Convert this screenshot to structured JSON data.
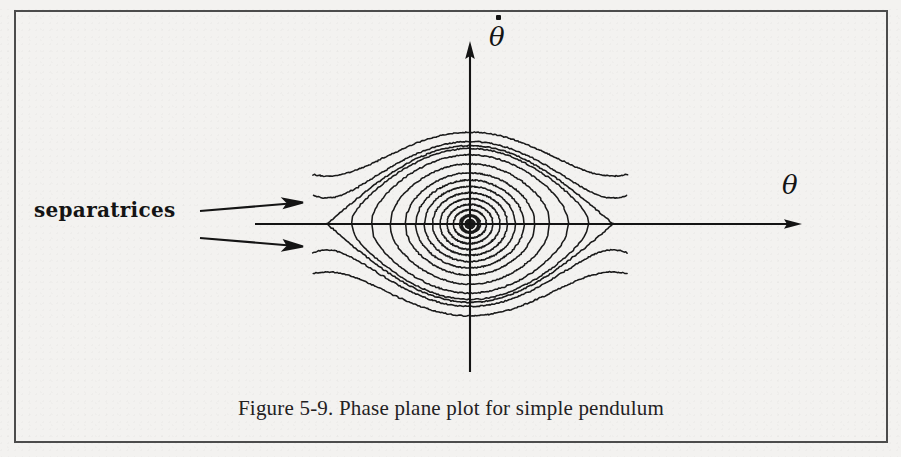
{
  "figure": {
    "caption": "Figure 5-9.  Phase plane plot for simple pendulum",
    "border_color": "#4c4c4c",
    "background_color": "#f3f2f0",
    "curve_color": "#1a1a1a"
  },
  "annotations": {
    "separatrices_label": "separatrices",
    "arrow_count": 2
  },
  "axes": {
    "y_label": "θ",
    "y_label_accent": "dot",
    "y_label_full": "θ̇",
    "x_label": "θ",
    "origin_px": {
      "x": 470,
      "y": 224
    },
    "x_axis_start_px": 255,
    "x_axis_end_px": 800,
    "y_axis_top_px": 43,
    "y_axis_bottom_px": 372
  },
  "chart_data": {
    "type": "line",
    "title": "Figure 5-9.  Phase plane plot for simple pendulum",
    "xlabel": "θ",
    "ylabel": "θ̇",
    "grid": false,
    "legend": null,
    "system": "simple pendulum, thetaddot = -sin(theta)",
    "conserved_quantity": "E = 0.5*thetadot^2 - cos(theta)",
    "xlim": [
      -3.4,
      3.4
    ],
    "ylim": [
      -2.6,
      2.6
    ],
    "fixed_points": [
      {
        "type": "center",
        "theta": 0.0,
        "thetadot": 0.0
      },
      {
        "type": "saddle",
        "theta": -3.1416,
        "thetadot": 0.0
      },
      {
        "type": "saddle",
        "theta": 3.1416,
        "thetadot": 0.0
      }
    ],
    "series": [
      {
        "name": "libration-1",
        "kind": "closed-orbit",
        "energy": -0.995
      },
      {
        "name": "libration-2",
        "kind": "closed-orbit",
        "energy": -0.975
      },
      {
        "name": "libration-3",
        "kind": "closed-orbit",
        "energy": -0.935
      },
      {
        "name": "libration-4",
        "kind": "closed-orbit",
        "energy": -0.875
      },
      {
        "name": "libration-5",
        "kind": "closed-orbit",
        "energy": -0.79
      },
      {
        "name": "libration-6",
        "kind": "closed-orbit",
        "energy": -0.68
      },
      {
        "name": "libration-7",
        "kind": "closed-orbit",
        "energy": -0.54
      },
      {
        "name": "libration-8",
        "kind": "closed-orbit",
        "energy": -0.37
      },
      {
        "name": "libration-9",
        "kind": "closed-orbit",
        "energy": -0.15
      },
      {
        "name": "libration-10",
        "kind": "closed-orbit",
        "energy": 0.18
      },
      {
        "name": "libration-11",
        "kind": "closed-orbit",
        "energy": 0.56
      },
      {
        "name": "libration-12",
        "kind": "closed-orbit",
        "energy": 0.86
      },
      {
        "name": "separatrix-upper",
        "kind": "separatrix",
        "energy": 1.0
      },
      {
        "name": "separatrix-lower",
        "kind": "separatrix",
        "energy": 1.0
      },
      {
        "name": "rotation-upper-1",
        "kind": "rotation",
        "energy": 1.22
      },
      {
        "name": "rotation-upper-2",
        "kind": "rotation",
        "energy": 1.75
      },
      {
        "name": "rotation-lower-1",
        "kind": "rotation",
        "energy": 1.22
      },
      {
        "name": "rotation-lower-2",
        "kind": "rotation",
        "energy": 1.75
      }
    ]
  }
}
